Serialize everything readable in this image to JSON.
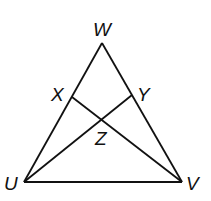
{
  "diagram": {
    "points": {
      "W": {
        "label": "W",
        "x": 102,
        "y": 43
      },
      "U": {
        "label": "U",
        "x": 24,
        "y": 182
      },
      "V": {
        "label": "V",
        "x": 182,
        "y": 182
      },
      "X": {
        "label": "X",
        "x": 72,
        "y": 97
      },
      "Y": {
        "label": "Y",
        "x": 132,
        "y": 95
      },
      "Z": {
        "label": "Z",
        "x": 103,
        "y": 118
      }
    },
    "segments": [
      "UW",
      "WV",
      "UV",
      "XV",
      "UY"
    ]
  }
}
